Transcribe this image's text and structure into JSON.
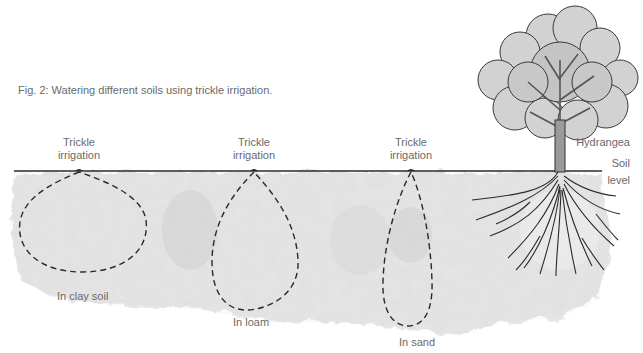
{
  "figure": {
    "caption": "Fig. 2: Watering different soils using trickle irrigation.",
    "tree": {
      "label": "Hydrangea"
    },
    "soil_level": {
      "label_line1": "Soil",
      "label_line2": "level"
    },
    "emitters": [
      {
        "label_line1": "Trickle",
        "label_line2": "irrigation",
        "soil_label": "In clay soil",
        "x": 79,
        "bulb_shape": "wide-round"
      },
      {
        "label_line1": "Trickle",
        "label_line2": "irrigation",
        "soil_label": "In loam",
        "x": 254,
        "bulb_shape": "teardrop"
      },
      {
        "label_line1": "Trickle",
        "label_line2": "irrigation",
        "soil_label": "In sand",
        "x": 411,
        "bulb_shape": "narrow-deep"
      }
    ],
    "colors": {
      "soil_fill": "#e6e6e6",
      "soil_shade": "#d6d6d6",
      "line": "#2a2a2a",
      "text": "#6a6a6a",
      "foliage": "#cfcfcf",
      "trunk": "#9a9a9a"
    }
  }
}
